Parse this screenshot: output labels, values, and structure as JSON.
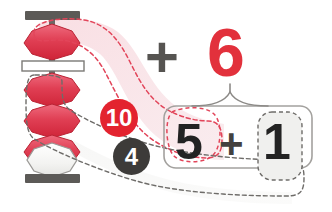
{
  "diagram": {
    "operator_main": "+",
    "addend": "6",
    "decomposition": {
      "left_digit": "5",
      "operator": "+",
      "right_digit": "1"
    },
    "badges": [
      {
        "name": "complement-ten",
        "label": "10",
        "color": "#e3232f"
      },
      {
        "name": "complement-four",
        "label": "4",
        "color": "#3d3b39"
      }
    ],
    "abacus": {
      "heaven_beads": [
        {
          "index": 0,
          "state": "active",
          "color": "#e2415a"
        }
      ],
      "earth_beads": [
        {
          "index": 0,
          "state": "active",
          "color": "#e2415a"
        },
        {
          "index": 1,
          "state": "active",
          "color": "#e2415a"
        },
        {
          "index": 2,
          "state": "active",
          "color": "#e2415a"
        },
        {
          "index": 3,
          "state": "inactive",
          "color": "#f4f4f2"
        }
      ],
      "frame_color": "#5c5a57",
      "reckoning_bar_color": "#ffffff"
    },
    "annotations": {
      "heaven_path_color": "#e2455a",
      "earth_path_color": "#6e6c69",
      "brace_color": "#8c8a87",
      "highlight_fill": "#f8dde2"
    }
  }
}
